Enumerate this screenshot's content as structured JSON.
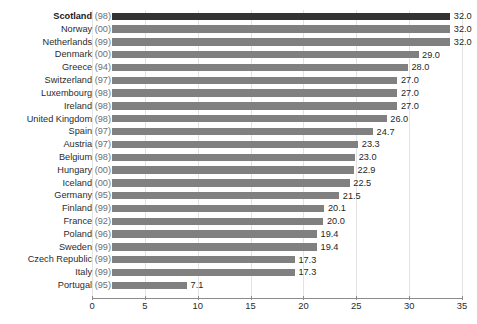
{
  "chart_data": {
    "type": "bar",
    "orientation": "horizontal",
    "title": "",
    "xlabel": "",
    "ylabel": "",
    "xlim": [
      0,
      35
    ],
    "xticks": [
      0,
      5,
      10,
      15,
      20,
      25,
      30,
      35
    ],
    "xtick_labels": [
      "0",
      "5",
      "10",
      "15",
      "20",
      "25",
      "30",
      "35"
    ],
    "grid": true,
    "grid_axis": "x",
    "legend": false,
    "value_labels": true,
    "highlight_category": "Scotland (98)",
    "colors": {
      "bar": "#808080",
      "bar_highlight": "#333333",
      "gridline": "#e3e3e3",
      "axis": "#8c8c8c",
      "label_text": "#2b2b2b",
      "year_text": "#6e6e70",
      "background": "#ffffff"
    },
    "categories": [
      "Scotland (98)",
      "Norway (00)",
      "Netherlands (99)",
      "Denmark (00)",
      "Greece (94)",
      "Switzerland (97)",
      "Luxembourg (98)",
      "Ireland (98)",
      "United Kingdom (98)",
      "Spain (97)",
      "Austria (97)",
      "Belgium (98)",
      "Hungary (00)",
      "Iceland (00)",
      "Germany (95)",
      "Finland (99)",
      "France (92)",
      "Poland (96)",
      "Sweden (99)",
      "Czech Republic (99)",
      "Italy (99)",
      "Portugal (95)"
    ],
    "values": [
      32.0,
      32.0,
      32.0,
      29.0,
      28.0,
      27.0,
      27.0,
      27.0,
      26.0,
      24.7,
      23.3,
      23.0,
      22.9,
      22.5,
      21.5,
      20.1,
      20.0,
      19.4,
      19.4,
      17.3,
      17.3,
      7.1
    ]
  },
  "rows": [
    {
      "country": "Scotland",
      "year": "(98)",
      "value": 32.0,
      "label": "32.0",
      "highlight": true
    },
    {
      "country": "Norway",
      "year": "(00)",
      "value": 32.0,
      "label": "32.0",
      "highlight": false
    },
    {
      "country": "Netherlands",
      "year": "(99)",
      "value": 32.0,
      "label": "32.0",
      "highlight": false
    },
    {
      "country": "Denmark",
      "year": "(00)",
      "value": 29.0,
      "label": "29.0",
      "highlight": false
    },
    {
      "country": "Greece",
      "year": "(94)",
      "value": 28.0,
      "label": "28.0",
      "highlight": false
    },
    {
      "country": "Switzerland",
      "year": "(97)",
      "value": 27.0,
      "label": "27.0",
      "highlight": false
    },
    {
      "country": "Luxembourg",
      "year": "(98)",
      "value": 27.0,
      "label": "27.0",
      "highlight": false
    },
    {
      "country": "Ireland",
      "year": "(98)",
      "value": 27.0,
      "label": "27.0",
      "highlight": false
    },
    {
      "country": "United Kingdom",
      "year": "(98)",
      "value": 26.0,
      "label": "26.0",
      "highlight": false
    },
    {
      "country": "Spain",
      "year": "(97)",
      "value": 24.7,
      "label": "24.7",
      "highlight": false
    },
    {
      "country": "Austria",
      "year": "(97)",
      "value": 23.3,
      "label": "23.3",
      "highlight": false
    },
    {
      "country": "Belgium",
      "year": "(98)",
      "value": 23.0,
      "label": "23.0",
      "highlight": false
    },
    {
      "country": "Hungary",
      "year": "(00)",
      "value": 22.9,
      "label": "22.9",
      "highlight": false
    },
    {
      "country": "Iceland",
      "year": "(00)",
      "value": 22.5,
      "label": "22.5",
      "highlight": false
    },
    {
      "country": "Germany",
      "year": "(95)",
      "value": 21.5,
      "label": "21.5",
      "highlight": false
    },
    {
      "country": "Finland",
      "year": "(99)",
      "value": 20.1,
      "label": "20.1",
      "highlight": false
    },
    {
      "country": "France",
      "year": "(92)",
      "value": 20.0,
      "label": "20.0",
      "highlight": false
    },
    {
      "country": "Poland",
      "year": "(96)",
      "value": 19.4,
      "label": "19.4",
      "highlight": false
    },
    {
      "country": "Sweden",
      "year": "(99)",
      "value": 19.4,
      "label": "19.4",
      "highlight": false
    },
    {
      "country": "Czech Republic",
      "year": "(99)",
      "value": 17.3,
      "label": "17.3",
      "highlight": false
    },
    {
      "country": "Italy",
      "year": "(99)",
      "value": 17.3,
      "label": "17.3",
      "highlight": false
    },
    {
      "country": "Portugal",
      "year": "(95)",
      "value": 7.1,
      "label": "7.1",
      "highlight": false
    }
  ],
  "axis": {
    "ticks": [
      {
        "value": 0,
        "label": "0"
      },
      {
        "value": 5,
        "label": "5"
      },
      {
        "value": 10,
        "label": "10"
      },
      {
        "value": 15,
        "label": "15"
      },
      {
        "value": 20,
        "label": "20"
      },
      {
        "value": 25,
        "label": "25"
      },
      {
        "value": 30,
        "label": "30"
      },
      {
        "value": 35,
        "label": "35"
      }
    ],
    "max": 35
  }
}
